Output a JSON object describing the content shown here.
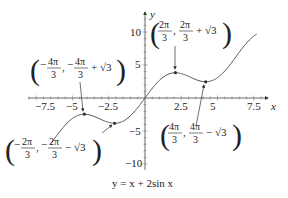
{
  "chart_data": {
    "type": "line",
    "title": "y = x + 2sin x",
    "xlabel": "x",
    "ylabel": "y",
    "xlim": [
      -7.5,
      7.5
    ],
    "ylim": [
      -10,
      10
    ],
    "x_ticks": [
      "-7.5",
      "-5",
      "-2.5",
      "2.5",
      "5",
      "7.5"
    ],
    "y_ticks": [
      "10",
      "5",
      "-5",
      "-10"
    ],
    "function": "x + 2 sin x",
    "x_domain": [
      -6.5,
      7.7
    ],
    "critical_points": [
      {
        "label": "(-4π/3, -4π/3 + √3)",
        "x": -4.189,
        "y": -2.457,
        "kind": "local max"
      },
      {
        "label": "(-2π/3, -2π/3 - √3)",
        "x": -2.094,
        "y": -3.826,
        "kind": "local min"
      },
      {
        "label": "(2π/3, 2π/3 + √3)",
        "x": 2.094,
        "y": 3.826,
        "kind": "local max"
      },
      {
        "label": "(4π/3, 4π/3 - √3)",
        "x": 4.189,
        "y": 2.457,
        "kind": "local min"
      }
    ],
    "grid": false,
    "legend": null
  },
  "labels": {
    "caption": "y = x + 2sin x",
    "x_axis": "x",
    "y_axis": "y",
    "tick_x": [
      "−7.5",
      "−5",
      "−2.5",
      "2.5",
      "5",
      "7.5"
    ],
    "tick_y": [
      "10",
      "5",
      "−5",
      "−10"
    ],
    "p1_a": "−",
    "p1_num1": "4π",
    "p1_den1": "3",
    "p1_mid": ", −",
    "p1_num2": "4π",
    "p1_den2": "3",
    "p1_tail": "+ √3",
    "p2_num1": "2π",
    "p2_den1": "3",
    "p2_num2": "2π",
    "p2_den2": "3",
    "p2_tail": "+ √3",
    "p3_num1": "2π",
    "p3_den1": "3",
    "p3_num2": "2π",
    "p3_den2": "3",
    "p3_tail": "− √3",
    "p4_num1": "4π",
    "p4_den1": "3",
    "p4_num2": "4π",
    "p4_den2": "3",
    "p4_tail": "− √3",
    "comma": ",",
    "minus": "−"
  }
}
